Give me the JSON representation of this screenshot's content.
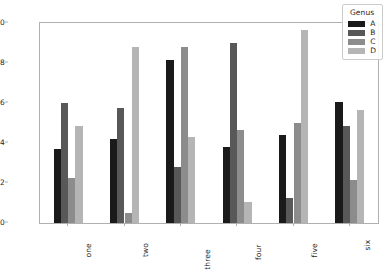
{
  "chart_data": {
    "type": "bar",
    "title": "",
    "xlabel": "",
    "ylabel": "",
    "categories": [
      "one",
      "two",
      "three",
      "four",
      "five",
      "six"
    ],
    "ylim": [
      0.0,
      1.0
    ],
    "yticks": [
      "0.0",
      "0.2",
      "0.4",
      "0.6",
      "0.8",
      "1.0"
    ],
    "ytick_values": [
      0.0,
      0.2,
      0.4,
      0.6,
      0.8,
      1.0
    ],
    "grid": false,
    "legend_title": "Genus",
    "legend_position": "upper right",
    "series": [
      {
        "name": "A",
        "color": "#1a1a1a",
        "values": [
          0.37,
          0.42,
          0.815,
          0.38,
          0.44,
          0.605
        ]
      },
      {
        "name": "B",
        "color": "#585858",
        "values": [
          0.6,
          0.575,
          0.28,
          0.9,
          0.125,
          0.485
        ]
      },
      {
        "name": "C",
        "color": "#8c8c8c",
        "values": [
          0.225,
          0.05,
          0.88,
          0.465,
          0.5,
          0.215
        ]
      },
      {
        "name": "D",
        "color": "#b5b5b5",
        "values": [
          0.485,
          0.88,
          0.43,
          0.105,
          0.965,
          0.565
        ]
      }
    ]
  },
  "legend": {
    "title": "Genus",
    "items": [
      {
        "label": "A",
        "color": "#1a1a1a"
      },
      {
        "label": "B",
        "color": "#585858"
      },
      {
        "label": "C",
        "color": "#8c8c8c"
      },
      {
        "label": "D",
        "color": "#b5b5b5"
      }
    ]
  },
  "axes": {
    "y_tick_labels": [
      "1.0",
      "0.8",
      "0.6",
      "0.4",
      "0.2",
      "0.0"
    ],
    "x_tick_labels": [
      "one",
      "two",
      "three",
      "four",
      "five",
      "six"
    ]
  }
}
